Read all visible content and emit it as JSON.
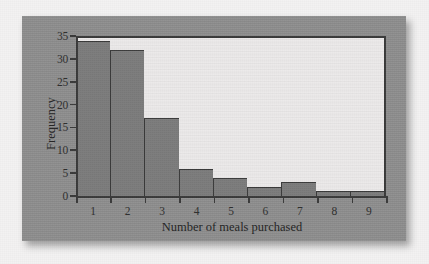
{
  "chart_data": {
    "type": "bar",
    "title": "",
    "subtitle": "",
    "xlabel": "Number of meals purchased",
    "ylabel": "Frequency",
    "categories": [
      "1",
      "2",
      "3",
      "4",
      "5",
      "6",
      "7",
      "8",
      "9"
    ],
    "values": [
      34,
      32,
      17,
      6,
      4,
      2,
      3,
      1,
      1
    ],
    "series": [
      {
        "name": "Frequency",
        "values": [
          34,
          32,
          17,
          6,
          4,
          2,
          3,
          1,
          1
        ]
      }
    ],
    "ylim": [
      0,
      35
    ],
    "xlim": [
      0.5,
      9.5
    ],
    "y_ticks": [
      0,
      5,
      10,
      15,
      20,
      25,
      30,
      35
    ],
    "y_tick_labels": [
      "0",
      "5",
      "10",
      "15",
      "20",
      "25",
      "30",
      "35"
    ],
    "x_tick_labels": [
      "1",
      "2",
      "3",
      "4",
      "5",
      "6",
      "7",
      "8",
      "9"
    ],
    "grid": false,
    "legend": false,
    "legend_position": "none",
    "annotations": [],
    "colors": {
      "bar_fill": "#7b7b7b",
      "bar_edge": "#3a3a3a",
      "plot_background": "#eceaea",
      "panel_background": "#8e8e8e",
      "page_background": "#f3f2f2",
      "axis": "#3a3a3a",
      "text": "#2e2e2e"
    }
  }
}
